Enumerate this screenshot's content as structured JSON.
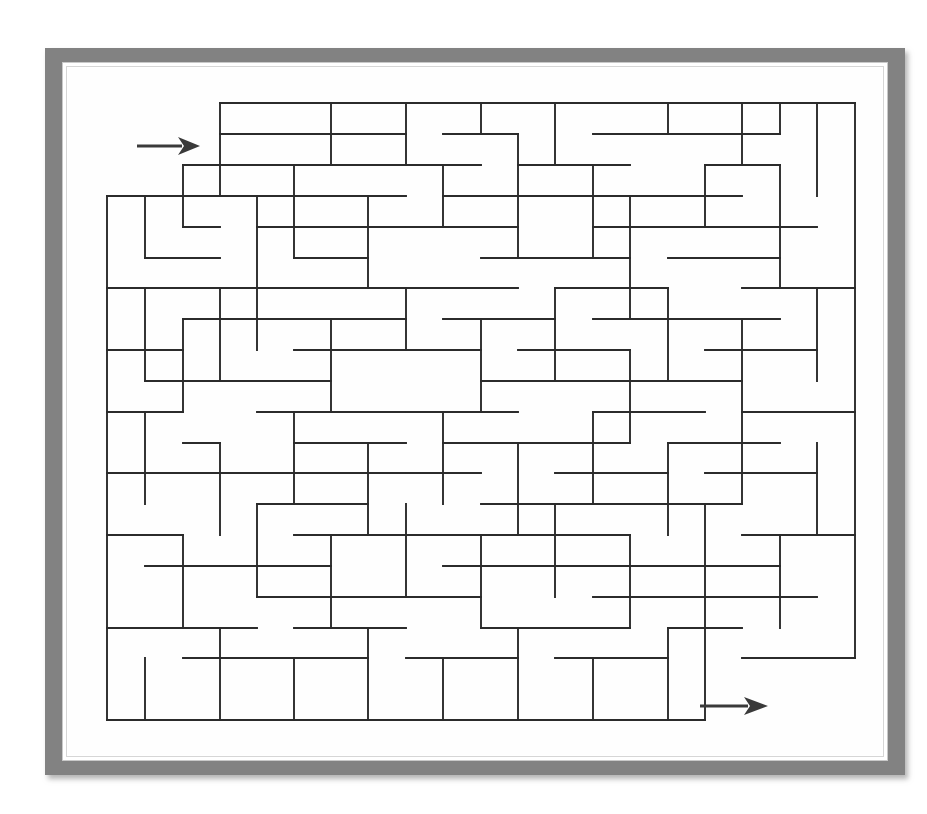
{
  "page": {
    "title": "Rectangular Maze Puzzle",
    "background_color": "#ffffff",
    "width": 927,
    "height": 814
  },
  "frame": {
    "name": "picture-frame",
    "outer_color": "#828282",
    "mat_color": "#ffffff",
    "shadow_color": "#9a9a9a",
    "outer": {
      "x": 45,
      "y": 48,
      "width": 860,
      "height": 727
    },
    "mat": {
      "x": 62,
      "y": 62,
      "width": 826,
      "height": 699
    }
  },
  "maze": {
    "name": "maze-grid",
    "wall_color": "#2b2b2b",
    "wall_thickness": 1.9,
    "cols": 20,
    "rows": 20,
    "origin_x": 107,
    "origin_y": 103,
    "cell_w": 37.4,
    "cell_h": 30.85,
    "entrance_label": "entry-arrow",
    "exit_label": "exit-arrow",
    "h_walls": [
      "0:3,4,5,6,7,8,9,10,11,12,13,14,15,16,17,18,19",
      "1:0,1,2,3,6,9,11,14,16,17,18,19",
      "2:0,1,4,5,8,9,11,12,14,18",
      "3:2,3,7,9,10,13,14,16,17,19",
      "4:0,1,5,6,8,12,14,15,17",
      "5:2,3,4,7,10,11,12,16,18,19",
      "6:0,1,6,8,9,13,15,17",
      "7:2,4,5,7,10,11,12,14,16,18,19",
      "8:0,1,3,6,8,9,11,13,15,17",
      "9:2,4,5,7,10,12,14,16,18,19",
      "10:0,1,3,6,8,9,11,13,15,17,18",
      "11:2,4,5,7,9,10,12,14,16,19",
      "12:0,1,3,6,8,11,13,15,17,18",
      "13:2,4,5,7,9,10,12,14,16,19",
      "14:0,1,3,6,8,11,13,15,17",
      "15:2,4,5,7,9,12,14,16,18,19",
      "16:0,1,3,6,8,10,11,13,15,17",
      "17:2,4,5,7,9,12,14,16,18",
      "18:0,1,3,6,8,10,13,15,17,19",
      "19:2,4,7,9,11,12,14,16,18",
      "20:0,1,2,3,4,5,6,7,8,9,10,11,12,13,14,15"
    ],
    "v_walls": [
      "0:1,2,3,4,5,6,7,8,9,10,11,12,13,14,15,16,17,18,19",
      "20:0,1,2,3,4,5,6,7,8,9,10,11,12,13,14,15,16,17",
      "1:3,6,9,12,15,18",
      "2:1,4,7,10,13,16,19",
      "3:2,5,8,11,14,17",
      "4:0,3,6,9,12,15,18",
      "5:1,4,7,10,13,16,19",
      "6:2,5,8,11,14,17",
      "7:0,3,6,9,12,15,18",
      "8:1,4,7,10,13,16,19",
      "9:2,5,8,11,14,17",
      "10:0,3,6,9,12,15,18",
      "11:1,4,7,10,13,16,19",
      "12:2,5,8,11,14,17",
      "13:0,3,6,9,12,15,18",
      "14:1,4,7,10,13,16,19",
      "15:2,5,8,11,14,17",
      "16:0,3,6,9,12,15,18",
      "17:1,4,7,10,13,16,19",
      "18:2,5,8,11,14,17",
      "19:0,3,6,9,12,15,18"
    ],
    "segments_h": [
      [
        220,
        103,
        855,
        103
      ],
      [
        220,
        134,
        331,
        134
      ],
      [
        145,
        196,
        370,
        196
      ],
      [
        183,
        165,
        294,
        165
      ],
      [
        294,
        196,
        406,
        196
      ],
      [
        107,
        196,
        145,
        196
      ],
      [
        183,
        227,
        220,
        227
      ],
      [
        145,
        258,
        220,
        258
      ],
      [
        107,
        288,
        257,
        288
      ],
      [
        257,
        288,
        331,
        288
      ],
      [
        107,
        350,
        183,
        350
      ],
      [
        183,
        319,
        257,
        319
      ],
      [
        145,
        381,
        257,
        381
      ],
      [
        107,
        412,
        183,
        412
      ],
      [
        107,
        473,
        257,
        473
      ],
      [
        183,
        443,
        220,
        443
      ],
      [
        107,
        535,
        183,
        535
      ],
      [
        145,
        566,
        257,
        566
      ],
      [
        107,
        628,
        257,
        628
      ],
      [
        183,
        658,
        294,
        658
      ],
      [
        107,
        720,
        705,
        720
      ],
      [
        331,
        134,
        406,
        134
      ],
      [
        294,
        165,
        406,
        165
      ],
      [
        220,
        196,
        294,
        196
      ],
      [
        257,
        227,
        406,
        227
      ],
      [
        294,
        258,
        368,
        258
      ],
      [
        220,
        288,
        406,
        288
      ],
      [
        257,
        319,
        406,
        319
      ],
      [
        294,
        350,
        443,
        350
      ],
      [
        220,
        381,
        331,
        381
      ],
      [
        257,
        412,
        406,
        412
      ],
      [
        294,
        443,
        406,
        443
      ],
      [
        220,
        473,
        406,
        473
      ],
      [
        257,
        504,
        368,
        504
      ],
      [
        294,
        535,
        443,
        535
      ],
      [
        220,
        566,
        331,
        566
      ],
      [
        257,
        597,
        406,
        597
      ],
      [
        294,
        628,
        406,
        628
      ],
      [
        257,
        658,
        368,
        658
      ],
      [
        406,
        103,
        481,
        103
      ],
      [
        443,
        134,
        518,
        134
      ],
      [
        406,
        165,
        481,
        165
      ],
      [
        443,
        196,
        555,
        196
      ],
      [
        406,
        227,
        518,
        227
      ],
      [
        481,
        258,
        593,
        258
      ],
      [
        406,
        288,
        518,
        288
      ],
      [
        443,
        319,
        555,
        319
      ],
      [
        406,
        350,
        481,
        350
      ],
      [
        481,
        381,
        593,
        381
      ],
      [
        406,
        412,
        518,
        412
      ],
      [
        443,
        443,
        555,
        443
      ],
      [
        406,
        473,
        481,
        473
      ],
      [
        481,
        504,
        593,
        504
      ],
      [
        406,
        535,
        518,
        535
      ],
      [
        443,
        566,
        555,
        566
      ],
      [
        406,
        597,
        481,
        597
      ],
      [
        481,
        628,
        593,
        628
      ],
      [
        406,
        658,
        518,
        658
      ],
      [
        555,
        103,
        668,
        103
      ],
      [
        593,
        134,
        668,
        134
      ],
      [
        518,
        165,
        630,
        165
      ],
      [
        555,
        196,
        668,
        196
      ],
      [
        593,
        227,
        705,
        227
      ],
      [
        518,
        258,
        630,
        258
      ],
      [
        555,
        288,
        668,
        288
      ],
      [
        593,
        319,
        705,
        319
      ],
      [
        518,
        350,
        630,
        350
      ],
      [
        555,
        381,
        668,
        381
      ],
      [
        593,
        412,
        705,
        412
      ],
      [
        518,
        443,
        630,
        443
      ],
      [
        555,
        473,
        668,
        473
      ],
      [
        593,
        504,
        705,
        504
      ],
      [
        518,
        535,
        630,
        535
      ],
      [
        555,
        566,
        668,
        566
      ],
      [
        593,
        597,
        705,
        597
      ],
      [
        518,
        628,
        630,
        628
      ],
      [
        555,
        658,
        668,
        658
      ],
      [
        668,
        134,
        780,
        134
      ],
      [
        705,
        165,
        780,
        165
      ],
      [
        668,
        196,
        742,
        196
      ],
      [
        705,
        227,
        817,
        227
      ],
      [
        668,
        258,
        780,
        258
      ],
      [
        742,
        288,
        855,
        288
      ],
      [
        668,
        319,
        780,
        319
      ],
      [
        705,
        350,
        817,
        350
      ],
      [
        668,
        381,
        742,
        381
      ],
      [
        742,
        412,
        855,
        412
      ],
      [
        668,
        443,
        780,
        443
      ],
      [
        705,
        473,
        817,
        473
      ],
      [
        668,
        504,
        742,
        504
      ],
      [
        742,
        535,
        855,
        535
      ],
      [
        668,
        566,
        780,
        566
      ],
      [
        705,
        597,
        817,
        597
      ],
      [
        668,
        628,
        742,
        628
      ],
      [
        742,
        658,
        855,
        658
      ],
      [
        780,
        103,
        855,
        103
      ]
    ],
    "segments_v": [
      [
        107,
        196,
        107,
        720
      ],
      [
        855,
        103,
        855,
        658
      ],
      [
        220,
        103,
        220,
        196
      ],
      [
        331,
        103,
        331,
        165
      ],
      [
        406,
        103,
        406,
        165
      ],
      [
        481,
        103,
        481,
        134
      ],
      [
        555,
        103,
        555,
        165
      ],
      [
        668,
        103,
        668,
        134
      ],
      [
        742,
        103,
        742,
        165
      ],
      [
        780,
        103,
        780,
        134
      ],
      [
        817,
        103,
        817,
        196
      ],
      [
        145,
        196,
        145,
        258
      ],
      [
        183,
        165,
        183,
        227
      ],
      [
        257,
        196,
        257,
        288
      ],
      [
        294,
        165,
        294,
        258
      ],
      [
        368,
        196,
        368,
        288
      ],
      [
        443,
        165,
        443,
        227
      ],
      [
        518,
        134,
        518,
        258
      ],
      [
        593,
        165,
        593,
        258
      ],
      [
        630,
        196,
        630,
        319
      ],
      [
        705,
        165,
        705,
        227
      ],
      [
        780,
        165,
        780,
        288
      ],
      [
        145,
        288,
        145,
        381
      ],
      [
        220,
        288,
        220,
        381
      ],
      [
        183,
        319,
        183,
        412
      ],
      [
        257,
        288,
        257,
        350
      ],
      [
        331,
        319,
        331,
        412
      ],
      [
        406,
        288,
        406,
        350
      ],
      [
        481,
        319,
        481,
        412
      ],
      [
        555,
        288,
        555,
        381
      ],
      [
        630,
        350,
        630,
        443
      ],
      [
        668,
        288,
        668,
        381
      ],
      [
        742,
        319,
        742,
        412
      ],
      [
        817,
        288,
        817,
        381
      ],
      [
        145,
        412,
        145,
        504
      ],
      [
        220,
        443,
        220,
        535
      ],
      [
        294,
        412,
        294,
        504
      ],
      [
        368,
        443,
        368,
        535
      ],
      [
        443,
        412,
        443,
        504
      ],
      [
        518,
        443,
        518,
        535
      ],
      [
        593,
        412,
        593,
        504
      ],
      [
        668,
        443,
        668,
        535
      ],
      [
        742,
        412,
        742,
        504
      ],
      [
        817,
        443,
        817,
        535
      ],
      [
        183,
        535,
        183,
        628
      ],
      [
        257,
        504,
        257,
        597
      ],
      [
        331,
        535,
        331,
        628
      ],
      [
        406,
        504,
        406,
        597
      ],
      [
        481,
        535,
        481,
        628
      ],
      [
        555,
        504,
        555,
        597
      ],
      [
        630,
        535,
        630,
        628
      ],
      [
        705,
        504,
        705,
        720
      ],
      [
        780,
        535,
        780,
        628
      ],
      [
        145,
        658,
        145,
        720
      ],
      [
        220,
        628,
        220,
        720
      ],
      [
        294,
        658,
        294,
        720
      ],
      [
        368,
        628,
        368,
        720
      ],
      [
        443,
        658,
        443,
        720
      ],
      [
        518,
        628,
        518,
        720
      ],
      [
        593,
        658,
        593,
        720
      ],
      [
        668,
        628,
        668,
        720
      ]
    ]
  },
  "arrows": {
    "entry": {
      "name": "entry-arrow",
      "direction": "right",
      "shaft_start_x": 137,
      "shaft_end_x": 182,
      "y": 146,
      "tip_x": 200,
      "color": "#3a3a3a"
    },
    "exit": {
      "name": "exit-arrow",
      "direction": "right",
      "shaft_start_x": 700,
      "shaft_end_x": 748,
      "y": 706,
      "tip_x": 768,
      "color": "#3a3a3a"
    }
  }
}
